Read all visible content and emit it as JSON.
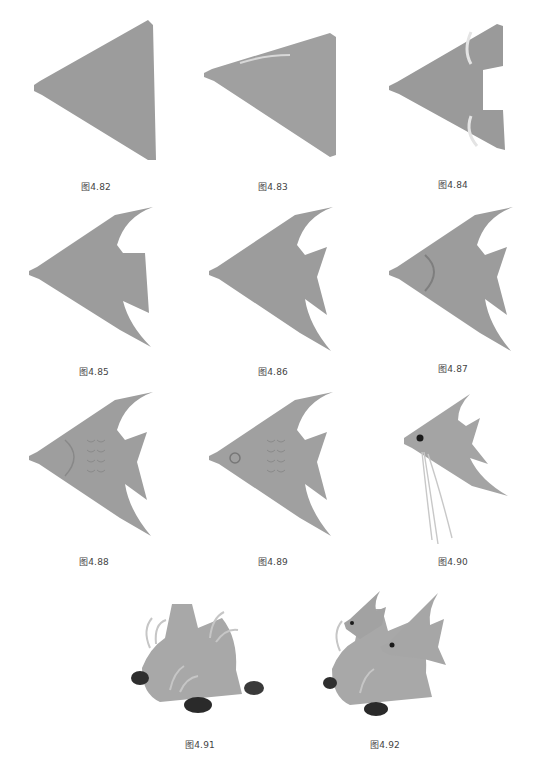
{
  "page": {
    "colors": {
      "fish": "#9a9a9a",
      "fish_light": "#b4b4b4",
      "fish_dark": "#7e7e7e",
      "caption": "#444444",
      "coral_dark": "#2e2e2e"
    }
  },
  "figures": [
    {
      "id": "fig-4-82",
      "caption": "图4.82",
      "stage": "triangle-blank"
    },
    {
      "id": "fig-4-83",
      "caption": "图4.83",
      "stage": "dorsal-groove"
    },
    {
      "id": "fig-4-84",
      "caption": "图4.84",
      "stage": "tail-notches"
    },
    {
      "id": "fig-4-85",
      "caption": "图4.85",
      "stage": "fins-outlined"
    },
    {
      "id": "fig-4-86",
      "caption": "图4.86",
      "stage": "tail-shaped"
    },
    {
      "id": "fig-4-87",
      "caption": "图4.87",
      "stage": "gill-carved"
    },
    {
      "id": "fig-4-88",
      "caption": "图4.88",
      "stage": "scales-carved"
    },
    {
      "id": "fig-4-89",
      "caption": "图4.89",
      "stage": "eye-carved"
    },
    {
      "id": "fig-4-90",
      "caption": "图4.90",
      "stage": "finished-fish"
    },
    {
      "id": "fig-4-91",
      "caption": "图4.91",
      "stage": "coral-rock"
    },
    {
      "id": "fig-4-92",
      "caption": "图4.92",
      "stage": "assembled-scene"
    }
  ]
}
